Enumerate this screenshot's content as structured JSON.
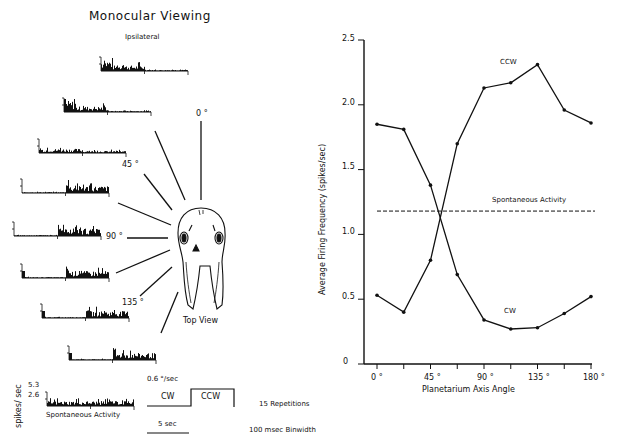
{
  "left_panel": {
    "title": "Monocular Viewing",
    "subtitle": "Ipsilateral",
    "angle_labels": [
      "0 °",
      "45 °",
      "90 °",
      "135 °"
    ],
    "head_caption": "Top View",
    "scale": {
      "ylabel": "spikes/ sec",
      "y_ticks": [
        "5.3",
        "2.6"
      ],
      "spontaneous_label": "Spontaneous Activity",
      "speed_label": "0.6 °/sec",
      "cw_label": "CW",
      "ccw_label": "CCW",
      "time_bar_label": "5 sec",
      "repetitions": "15 Repetitions",
      "binwidth": "100 msec Binwidth"
    }
  },
  "chart_data": {
    "type": "line",
    "title": "",
    "xlabel": "Planetarium Axis Angle",
    "ylabel": "Average Firing Frequency (spikes/sec)",
    "x": [
      0,
      22.5,
      45,
      67.5,
      90,
      112.5,
      135,
      157.5,
      180
    ],
    "x_tick_labels": [
      "0 °",
      "45 °",
      "90 °",
      "135 °",
      "180 °"
    ],
    "y_tick_labels": [
      "0",
      "0.5",
      "1.0",
      "1.5",
      "2.0",
      "2.5"
    ],
    "ylim": [
      0,
      2.5
    ],
    "xlim": [
      0,
      180
    ],
    "grid": false,
    "series": [
      {
        "name": "CCW",
        "values": [
          0.53,
          0.4,
          0.8,
          1.7,
          2.13,
          2.17,
          2.31,
          1.96,
          1.86
        ]
      },
      {
        "name": "CW",
        "values": [
          1.85,
          1.81,
          1.38,
          0.69,
          0.34,
          0.27,
          0.28,
          0.39,
          0.52
        ]
      }
    ],
    "reference_lines": [
      {
        "name": "Spontaneous Activity",
        "value": 1.18,
        "style": "dashed"
      }
    ],
    "annotations": [
      "CCW",
      "CW",
      "Spontaneous Activity"
    ]
  }
}
